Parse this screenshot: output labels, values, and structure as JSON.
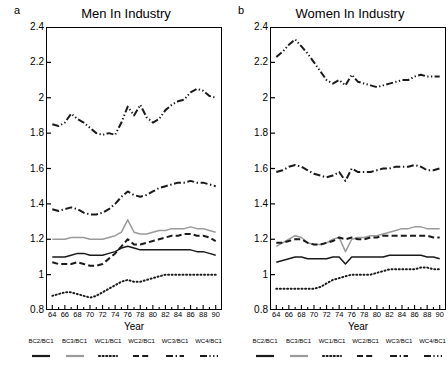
{
  "figure": {
    "width": 448,
    "height": 368,
    "background": "#ffffff"
  },
  "panels": [
    {
      "letter": "a",
      "title": "Men In Industry"
    },
    {
      "letter": "b",
      "title": "Women In Industry"
    }
  ],
  "axis": {
    "xlabel": "Year",
    "ylabel": "",
    "ylim": [
      0.8,
      2.4
    ],
    "yticks": [
      "0.8",
      "1",
      "1.2",
      "1.4",
      "1.6",
      "1.8",
      "2",
      "2.2",
      "2.4"
    ],
    "xlim": [
      63,
      91
    ],
    "xticks": [
      "64",
      "66",
      "68",
      "70",
      "72",
      "74",
      "76",
      "78",
      "80",
      "82",
      "84",
      "86",
      "88",
      "90"
    ],
    "grid": false
  },
  "legend": {
    "position": "below-axes",
    "entries": [
      {
        "label": "BC2/BC1",
        "style": "solid",
        "color": "#1a1a1a"
      },
      {
        "label": "BC3/BC1",
        "style": "solid",
        "color": "#9a9a9a"
      },
      {
        "label": "WC1/BC1",
        "style": "dotted",
        "color": "#1a1a1a"
      },
      {
        "label": "WC2/BC1",
        "style": "dashed",
        "color": "#1a1a1a"
      },
      {
        "label": "WC3/BC1",
        "style": "dashdot",
        "color": "#1a1a1a"
      },
      {
        "label": "WC4/BC1",
        "style": "dashdotdot",
        "color": "#1a1a1a"
      }
    ]
  },
  "chart_data": [
    {
      "type": "line",
      "title": "Men In Industry",
      "panel": "a",
      "xlabel": "Year",
      "ylabel": "",
      "xlim": [
        63,
        91
      ],
      "ylim": [
        0.8,
        2.4
      ],
      "grid": false,
      "x": [
        64,
        65,
        66,
        67,
        68,
        69,
        70,
        71,
        72,
        73,
        74,
        75,
        76,
        77,
        78,
        79,
        80,
        81,
        82,
        83,
        84,
        85,
        86,
        87,
        88,
        89,
        90
      ],
      "series": [
        {
          "name": "BC2/BC1",
          "style": "solid",
          "color": "#1a1a1a",
          "values": [
            1.1,
            1.1,
            1.1,
            1.11,
            1.12,
            1.12,
            1.11,
            1.11,
            1.11,
            1.12,
            1.13,
            1.15,
            1.16,
            1.15,
            1.14,
            1.14,
            1.14,
            1.14,
            1.14,
            1.14,
            1.14,
            1.14,
            1.14,
            1.13,
            1.13,
            1.12,
            1.11
          ]
        },
        {
          "name": "BC3/BC1",
          "style": "solid",
          "color": "#9a9a9a",
          "values": [
            1.2,
            1.2,
            1.2,
            1.21,
            1.21,
            1.21,
            1.2,
            1.2,
            1.2,
            1.21,
            1.22,
            1.24,
            1.31,
            1.24,
            1.23,
            1.23,
            1.24,
            1.25,
            1.25,
            1.26,
            1.26,
            1.26,
            1.27,
            1.26,
            1.26,
            1.25,
            1.24
          ]
        },
        {
          "name": "WC1/BC1",
          "style": "dotted",
          "color": "#1a1a1a",
          "values": [
            0.88,
            0.89,
            0.9,
            0.9,
            0.89,
            0.88,
            0.87,
            0.88,
            0.9,
            0.92,
            0.94,
            0.96,
            0.97,
            0.96,
            0.96,
            0.97,
            0.98,
            0.99,
            1.0,
            1.0,
            1.0,
            1.0,
            1.0,
            1.0,
            1.0,
            1.0,
            1.0
          ]
        },
        {
          "name": "WC2/BC1",
          "style": "dashed",
          "color": "#1a1a1a",
          "values": [
            1.07,
            1.06,
            1.06,
            1.06,
            1.07,
            1.06,
            1.05,
            1.05,
            1.06,
            1.09,
            1.12,
            1.16,
            1.2,
            1.17,
            1.17,
            1.18,
            1.19,
            1.2,
            1.21,
            1.22,
            1.22,
            1.23,
            1.23,
            1.22,
            1.22,
            1.21,
            1.19
          ]
        },
        {
          "name": "WC3/BC1",
          "style": "dashdot",
          "color": "#1a1a1a",
          "values": [
            1.37,
            1.36,
            1.37,
            1.38,
            1.37,
            1.35,
            1.34,
            1.34,
            1.35,
            1.37,
            1.4,
            1.44,
            1.47,
            1.45,
            1.44,
            1.45,
            1.47,
            1.49,
            1.5,
            1.51,
            1.52,
            1.52,
            1.53,
            1.52,
            1.52,
            1.51,
            1.5
          ]
        },
        {
          "name": "WC4/BC1",
          "style": "dashdotdot",
          "color": "#1a1a1a",
          "values": [
            1.85,
            1.84,
            1.86,
            1.91,
            1.88,
            1.86,
            1.83,
            1.8,
            1.79,
            1.8,
            1.79,
            1.86,
            1.95,
            1.9,
            1.96,
            1.89,
            1.86,
            1.88,
            1.93,
            1.96,
            1.98,
            1.99,
            2.03,
            2.05,
            2.04,
            2.01,
            2.0
          ]
        }
      ]
    },
    {
      "type": "line",
      "title": "Women In Industry",
      "panel": "b",
      "xlabel": "Year",
      "ylabel": "",
      "xlim": [
        63,
        91
      ],
      "ylim": [
        0.8,
        2.4
      ],
      "grid": false,
      "x": [
        64,
        65,
        66,
        67,
        68,
        69,
        70,
        71,
        72,
        73,
        74,
        75,
        76,
        77,
        78,
        79,
        80,
        81,
        82,
        83,
        84,
        85,
        86,
        87,
        88,
        89,
        90
      ],
      "series": [
        {
          "name": "BC2/BC1",
          "style": "solid",
          "color": "#1a1a1a",
          "values": [
            1.07,
            1.08,
            1.09,
            1.1,
            1.1,
            1.09,
            1.09,
            1.09,
            1.09,
            1.1,
            1.1,
            1.06,
            1.1,
            1.1,
            1.1,
            1.1,
            1.1,
            1.1,
            1.11,
            1.11,
            1.11,
            1.11,
            1.11,
            1.11,
            1.1,
            1.1,
            1.09
          ]
        },
        {
          "name": "BC3/BC1",
          "style": "solid",
          "color": "#9a9a9a",
          "values": [
            1.16,
            1.18,
            1.2,
            1.22,
            1.21,
            1.18,
            1.17,
            1.17,
            1.18,
            1.2,
            1.21,
            1.13,
            1.2,
            1.21,
            1.21,
            1.22,
            1.22,
            1.23,
            1.24,
            1.25,
            1.26,
            1.26,
            1.27,
            1.27,
            1.26,
            1.26,
            1.26
          ]
        },
        {
          "name": "WC1/BC1",
          "style": "dotted",
          "color": "#1a1a1a",
          "values": [
            0.92,
            0.92,
            0.92,
            0.92,
            0.92,
            0.92,
            0.92,
            0.93,
            0.95,
            0.97,
            0.98,
            0.99,
            1.0,
            1.0,
            1.0,
            1.0,
            1.01,
            1.02,
            1.03,
            1.03,
            1.03,
            1.03,
            1.03,
            1.04,
            1.04,
            1.03,
            1.03
          ]
        },
        {
          "name": "WC2/BC1",
          "style": "dashed",
          "color": "#1a1a1a",
          "values": [
            1.18,
            1.18,
            1.19,
            1.2,
            1.2,
            1.18,
            1.17,
            1.17,
            1.18,
            1.19,
            1.21,
            1.2,
            1.21,
            1.2,
            1.2,
            1.21,
            1.21,
            1.22,
            1.22,
            1.22,
            1.22,
            1.22,
            1.22,
            1.22,
            1.22,
            1.21,
            1.21
          ]
        },
        {
          "name": "WC3/BC1",
          "style": "dashdot",
          "color": "#1a1a1a",
          "values": [
            1.58,
            1.59,
            1.61,
            1.62,
            1.61,
            1.59,
            1.57,
            1.56,
            1.55,
            1.56,
            1.58,
            1.53,
            1.6,
            1.58,
            1.58,
            1.58,
            1.59,
            1.6,
            1.6,
            1.61,
            1.61,
            1.61,
            1.62,
            1.61,
            1.59,
            1.59,
            1.6
          ]
        },
        {
          "name": "WC4/BC1",
          "style": "dashdotdot",
          "color": "#1a1a1a",
          "values": [
            2.23,
            2.26,
            2.3,
            2.33,
            2.29,
            2.25,
            2.2,
            2.15,
            2.1,
            2.08,
            2.1,
            2.07,
            2.13,
            2.09,
            2.08,
            2.07,
            2.06,
            2.07,
            2.08,
            2.09,
            2.1,
            2.1,
            2.12,
            2.13,
            2.12,
            2.12,
            2.12
          ]
        }
      ]
    }
  ]
}
